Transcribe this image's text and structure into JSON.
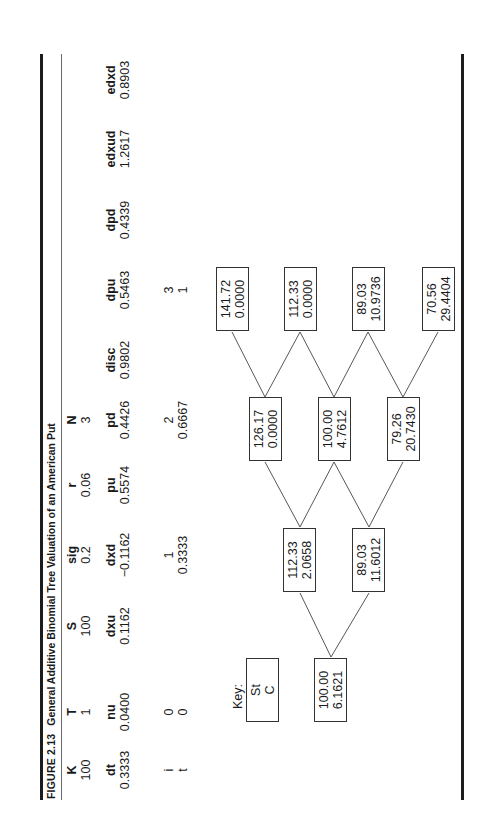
{
  "figure": {
    "number": "FIGURE 2.13",
    "caption": "General Additive Binomial Tree Valuation of an American Put"
  },
  "params_row1": [
    {
      "label": "K",
      "value": "100"
    },
    {
      "label": "T",
      "value": "1"
    },
    {
      "label": "S",
      "value": "100"
    },
    {
      "label": "sig",
      "value": "0.2"
    },
    {
      "label": "r",
      "value": "0.06"
    },
    {
      "label": "N",
      "value": "3"
    }
  ],
  "params_row2": [
    {
      "label": "dt",
      "value": "0.3333"
    },
    {
      "label": "nu",
      "value": "0.0400"
    },
    {
      "label": "dxu",
      "value": "0.1162"
    },
    {
      "label": "dxd",
      "value": "−0.1162"
    },
    {
      "label": "pu",
      "value": "0.5574"
    },
    {
      "label": "pd",
      "value": "0.4426"
    },
    {
      "label": "disc",
      "value": "0.9802"
    },
    {
      "label": "dpu",
      "value": "0.5463"
    },
    {
      "label": "dpd",
      "value": "0.4339"
    },
    {
      "label": "edxud",
      "value": "1.2617"
    },
    {
      "label": "edxd",
      "value": "0.8903"
    }
  ],
  "time_steps": {
    "i_label": "i",
    "t_label": "t",
    "steps": [
      {
        "i": "0",
        "t": "0"
      },
      {
        "i": "1",
        "t": "0.3333"
      },
      {
        "i": "2",
        "t": "0.6667"
      },
      {
        "i": "3",
        "t": "1"
      }
    ]
  },
  "key": {
    "label": "Key:",
    "line1": "St",
    "line2": "C"
  },
  "tree": {
    "level0": [
      {
        "s": "100.00",
        "c": "6.1621"
      }
    ],
    "level1": [
      {
        "s": "112.33",
        "c": "2.0658"
      },
      {
        "s": "89.03",
        "c": "11.6012"
      }
    ],
    "level2": [
      {
        "s": "126.17",
        "c": "0.0000"
      },
      {
        "s": "100.00",
        "c": "4.7612"
      },
      {
        "s": "79.26",
        "c": "20.7430"
      }
    ],
    "level3": [
      {
        "s": "141.72",
        "c": "0.0000"
      },
      {
        "s": "112.33",
        "c": "0.0000"
      },
      {
        "s": "89.03",
        "c": "10.9736"
      },
      {
        "s": "70.56",
        "c": "29.4404"
      }
    ]
  }
}
